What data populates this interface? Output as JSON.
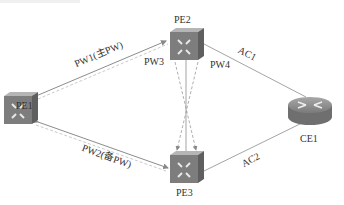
{
  "diagram": {
    "nodes": [
      {
        "id": "PE1",
        "label": "PE1",
        "type": "switch"
      },
      {
        "id": "PE2",
        "label": "PE2",
        "type": "switch"
      },
      {
        "id": "PE3",
        "label": "PE3",
        "type": "switch"
      },
      {
        "id": "CE1",
        "label": "CE1",
        "type": "router"
      }
    ],
    "links": [
      {
        "from": "PE1",
        "to": "PE2",
        "label": "PW1(主PW)",
        "style": "double-arrow"
      },
      {
        "from": "PE1",
        "to": "PE3",
        "label": "PW2(备PW)",
        "style": "double-arrow"
      },
      {
        "from": "PE2",
        "to": "PE3",
        "label": "PW3",
        "style": "dashed-cross"
      },
      {
        "from": "PE2",
        "to": "PE3",
        "label": "PW4",
        "style": "solid"
      },
      {
        "from": "PE2",
        "to": "CE1",
        "label": "AC1",
        "style": "solid"
      },
      {
        "from": "PE3",
        "to": "CE1",
        "label": "AC2",
        "style": "solid"
      }
    ]
  },
  "labels": {
    "pe1": "PE1",
    "pe2": "PE2",
    "pe3": "PE3",
    "ce1": "CE1",
    "pw1": "PW1(主PW)",
    "pw2": "PW2(备PW)",
    "pw3": "PW3",
    "pw4": "PW4",
    "ac1": "AC1",
    "ac2": "AC2"
  },
  "colors": {
    "line": "#9a9a9a",
    "device_front": "#7d7d7d",
    "device_side": "#5f5f5f",
    "device_top": "#b5b5b5",
    "router_body": "#8a8a8a"
  }
}
